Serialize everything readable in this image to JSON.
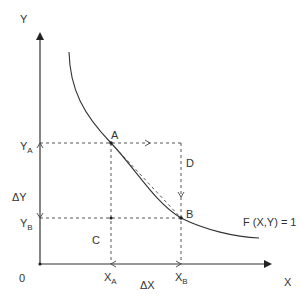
{
  "diagram": {
    "axes": {
      "x_label": "X",
      "y_label": "Y",
      "origin_label": "0"
    },
    "points": {
      "A": "A",
      "B": "B",
      "C": "C",
      "D": "D"
    },
    "axis_marks": {
      "y_a": "Y",
      "y_a_sub": "A",
      "y_b": "Y",
      "y_b_sub": "B",
      "x_a": "X",
      "x_a_sub": "A",
      "x_b": "X",
      "x_b_sub": "B",
      "delta_y": "ΔY",
      "delta_x": "ΔX"
    },
    "curve_label": "F (X,Y) = 1",
    "colors": {
      "line": "#333333",
      "background": "#ffffff"
    }
  }
}
